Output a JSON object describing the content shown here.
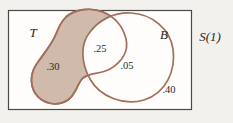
{
  "figure": {
    "type": "venn-euler-diagram",
    "sample_space": {
      "label": "S(1)"
    },
    "sets": [
      {
        "id": "T",
        "label": "T",
        "shaded": true
      },
      {
        "id": "B",
        "label": "B",
        "shaded": false
      }
    ],
    "regions": [
      {
        "name": "T-only",
        "value": ".30"
      },
      {
        "name": "T-and-B-intersection",
        "value": ".25"
      },
      {
        "name": "B-only",
        "value": ".05"
      },
      {
        "name": "outside-both-sets",
        "value": ".40"
      }
    ],
    "colors": {
      "set_fill": "#cfbaab",
      "set_outline": "#a36e5a",
      "frame_stroke": "#4a4a4a",
      "box_fill": "#fefdfb",
      "page_bg": "#f3f1ee",
      "text": "#2a2a2a"
    }
  }
}
